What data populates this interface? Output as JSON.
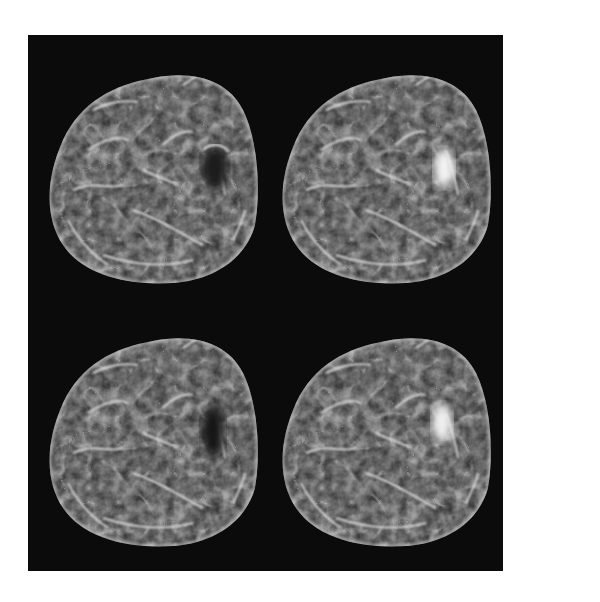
{
  "figure": {
    "type": "image_grid",
    "rows": 2,
    "cols": 2,
    "background_color": "#0b0b0b",
    "page_color": "#ffffff",
    "panels": [
      {
        "position": "top-left",
        "lesion": "dark"
      },
      {
        "position": "top-right",
        "lesion": "bright"
      },
      {
        "position": "bottom-left",
        "lesion": "dark"
      },
      {
        "position": "bottom-right",
        "lesion": "bright"
      }
    ]
  }
}
